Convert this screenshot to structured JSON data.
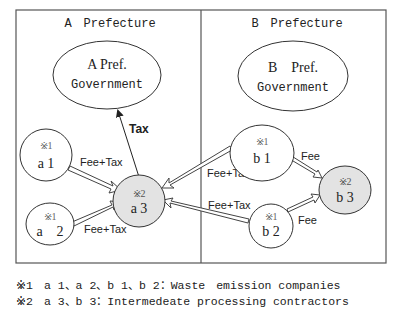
{
  "diagram": {
    "regions": [
      {
        "id": "A",
        "title": "A　Prefecture"
      },
      {
        "id": "B",
        "title": "B　Prefecture"
      }
    ],
    "nodes": {
      "a_gov": {
        "line1": "A Pref.",
        "line2": "Government"
      },
      "b_gov": {
        "line1": "B　Pref.",
        "line2": "Government"
      },
      "a1": {
        "mark": "※1",
        "label": "a 1"
      },
      "a2": {
        "mark": "※1",
        "label": "a　2"
      },
      "a3": {
        "mark": "※2",
        "label": "a 3"
      },
      "b1": {
        "mark": "※1",
        "label": "b 1"
      },
      "b2": {
        "mark": "※1",
        "label": "b 2"
      },
      "b3": {
        "mark": "※2",
        "label": "b 3"
      }
    },
    "edges": {
      "a1_a3": "Fee+Tax",
      "a2_a3": "Fee+Tax",
      "a3_agov": "Tax",
      "b1_a3": "Fee+Tax",
      "b2_a3": "Fee+Tax",
      "b1_b3": "Fee",
      "b2_b3": "Fee"
    },
    "colors": {
      "contractor_fill": "#e3e3e3",
      "stroke": "#333333"
    }
  },
  "legend": {
    "note1": "※1　a 1、a 2、b 1、b 2：Waste　emission companies",
    "note2": "※2　a 3、b 3：Intermedeate processing contractors"
  }
}
